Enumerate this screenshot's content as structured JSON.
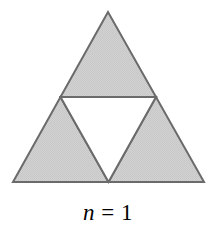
{
  "figure": {
    "name": "sierpinski-triangle-iteration",
    "caption": {
      "variable": "n",
      "operator": "=",
      "value": "1",
      "full_text": "n = 1"
    },
    "canvas": {
      "width": 216,
      "height": 227,
      "background_color": "#ffffff"
    },
    "style": {
      "fill_color": "#cfcfcf",
      "fill_texture": "dithered-halftone-gray",
      "stroke_color": "#6b6b6b",
      "stroke_width": 2,
      "hole_color": "#ffffff",
      "text_color": "#000000"
    },
    "geometry": {
      "outer_triangle": {
        "apex": [
          108,
          12
        ],
        "bottom_left": [
          13,
          182
        ],
        "bottom_right": [
          204,
          182
        ]
      },
      "midpoints": {
        "left_edge": [
          60.5,
          97
        ],
        "right_edge": [
          156,
          97
        ],
        "base": [
          108.5,
          182
        ]
      },
      "shaded_sub_triangles": [
        {
          "label": "top-sub-triangle",
          "points": "108,12 60.5,97 156,97"
        },
        {
          "label": "bottom-left-sub-triangle",
          "points": "60.5,97 13,182 108.5,182"
        },
        {
          "label": "bottom-right-sub-triangle",
          "points": "156,97 108.5,182 204,182"
        }
      ],
      "removed_triangle": {
        "label": "center-inverted-hole",
        "points": "60.5,97 156,97 108.5,182"
      }
    },
    "counts": {
      "iteration": 1,
      "shaded_triangles": 3,
      "removed_triangles": 1
    }
  }
}
